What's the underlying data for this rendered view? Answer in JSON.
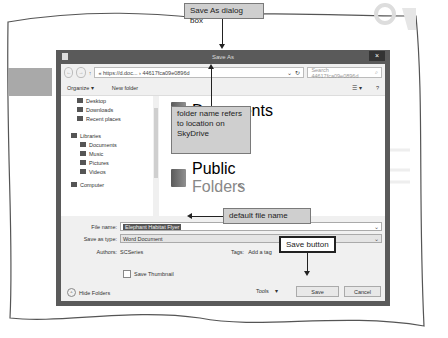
{
  "callouts": {
    "dialog_box": "Save As dialog box",
    "folder_name": "folder name refers to location on SkyDrive",
    "default_file_name": "default file name",
    "save_button": "Save button"
  },
  "dialog": {
    "title": "Save As",
    "close_label": "×",
    "address": {
      "back": "←",
      "forward": "→",
      "up": "↑",
      "path_prefix": "« https://d.doc...",
      "separator": "›",
      "folder": "44617fca09e0896d",
      "refresh": "↻",
      "dropdown": "⌄"
    },
    "search": {
      "placeholder": "Search 44617fca09e0896d",
      "icon": "⌕"
    },
    "toolbar": {
      "organize": "Organize ▾",
      "new_folder": "New folder",
      "view": "☰ ▾",
      "help": "?"
    },
    "nav": [
      {
        "label": "Desktop",
        "kind": "item"
      },
      {
        "label": "Downloads",
        "kind": "item"
      },
      {
        "label": "Recent places",
        "kind": "item"
      },
      {
        "label": "Libraries",
        "kind": "group"
      },
      {
        "label": "Documents",
        "kind": "sub"
      },
      {
        "label": "Music",
        "kind": "sub"
      },
      {
        "label": "Pictures",
        "kind": "sub"
      },
      {
        "label": "Videos",
        "kind": "sub"
      },
      {
        "label": "Computer",
        "kind": "group"
      }
    ],
    "files": [
      {
        "name": "Documents",
        "sub": ""
      },
      {
        "name": "Public",
        "sub": "Folders"
      }
    ],
    "form": {
      "file_name_label": "File name:",
      "file_name_value": "Elephant Habitat Flyer",
      "save_type_label": "Save as type:",
      "save_type_value": "Word Document",
      "authors_label": "Authors:",
      "authors_value": "SCSeries",
      "tags_label": "Tags:",
      "tags_value": "Add a tag",
      "thumbnail_label": "Save Thumbnail"
    },
    "footer": {
      "hide_folders": "Hide Folders",
      "tools": "Tools",
      "tools_arrow": "▾",
      "save": "Save",
      "cancel": "Cancel"
    }
  }
}
